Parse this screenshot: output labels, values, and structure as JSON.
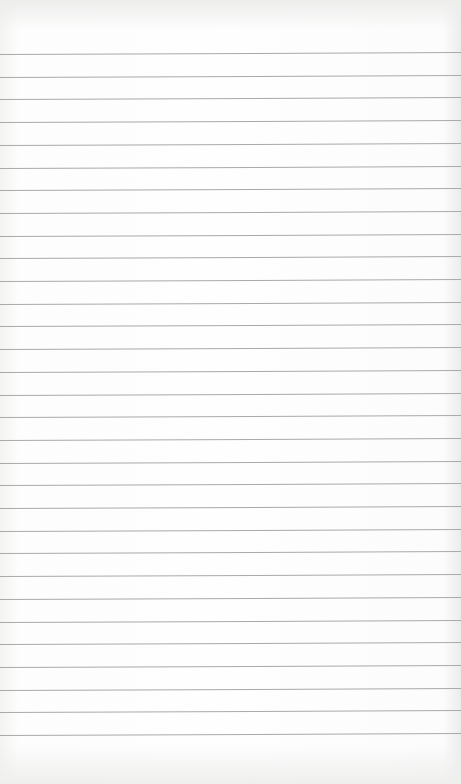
{
  "paper": {
    "type": "lined-notebook-paper",
    "content_text": "",
    "line_count": 31,
    "first_line_y": 54,
    "line_spacing": 22.7,
    "colors": {
      "background": "#fefefe",
      "rule_line": "#a9a9a9"
    }
  }
}
